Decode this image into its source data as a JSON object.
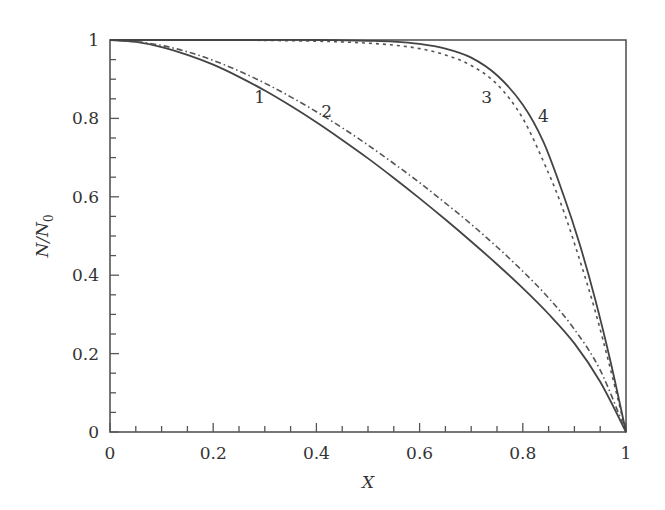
{
  "chart_data": {
    "type": "line",
    "title": "",
    "xlabel": "X",
    "ylabel": "N/N0",
    "ylabel_main": "N/N",
    "ylabel_sub": "0",
    "xlim": [
      0,
      1
    ],
    "ylim": [
      0,
      1
    ],
    "grid": false,
    "legend": "none (curves labeled inline 1–4)",
    "x_ticks": [
      "0",
      "0.2",
      "0.4",
      "0.6",
      "0.8",
      "1"
    ],
    "y_ticks": [
      "0",
      "0.2",
      "0.4",
      "0.6",
      "0.8",
      "1"
    ],
    "minor_tick_step": 0.05,
    "series": [
      {
        "name": "1",
        "style": "solid",
        "x": [
          0,
          0.05,
          0.1,
          0.15,
          0.2,
          0.25,
          0.3,
          0.35,
          0.4,
          0.45,
          0.5,
          0.55,
          0.6,
          0.65,
          0.7,
          0.75,
          0.8,
          0.85,
          0.9,
          0.95,
          1.0
        ],
        "y": [
          1.0,
          0.995,
          0.982,
          0.962,
          0.937,
          0.906,
          0.871,
          0.832,
          0.79,
          0.745,
          0.698,
          0.648,
          0.596,
          0.542,
          0.486,
          0.428,
          0.367,
          0.301,
          0.226,
          0.128,
          0.0
        ]
      },
      {
        "name": "2",
        "style": "dash-dot",
        "x": [
          0,
          0.05,
          0.1,
          0.15,
          0.2,
          0.25,
          0.3,
          0.35,
          0.4,
          0.45,
          0.5,
          0.55,
          0.6,
          0.65,
          0.7,
          0.75,
          0.8,
          0.85,
          0.9,
          0.95,
          1.0
        ],
        "y": [
          1.0,
          0.996,
          0.986,
          0.97,
          0.948,
          0.921,
          0.89,
          0.855,
          0.817,
          0.776,
          0.732,
          0.685,
          0.636,
          0.584,
          0.53,
          0.472,
          0.41,
          0.342,
          0.262,
          0.158,
          0.0
        ]
      },
      {
        "name": "3",
        "style": "dashed",
        "x": [
          0,
          0.1,
          0.2,
          0.3,
          0.4,
          0.45,
          0.5,
          0.55,
          0.6,
          0.65,
          0.7,
          0.75,
          0.8,
          0.85,
          0.88,
          0.91,
          0.94,
          0.97,
          1.0
        ],
        "y": [
          1.0,
          1.0,
          1.0,
          0.999,
          0.997,
          0.995,
          0.992,
          0.987,
          0.978,
          0.962,
          0.935,
          0.887,
          0.8,
          0.66,
          0.56,
          0.44,
          0.31,
          0.16,
          0.0
        ]
      },
      {
        "name": "4",
        "style": "solid",
        "x": [
          0,
          0.1,
          0.2,
          0.3,
          0.4,
          0.5,
          0.55,
          0.6,
          0.65,
          0.7,
          0.75,
          0.8,
          0.84,
          0.88,
          0.91,
          0.94,
          0.97,
          1.0
        ],
        "y": [
          1.0,
          1.0,
          1.0,
          1.0,
          1.0,
          0.998,
          0.996,
          0.99,
          0.978,
          0.955,
          0.91,
          0.835,
          0.74,
          0.6,
          0.48,
          0.34,
          0.18,
          0.0
        ]
      }
    ],
    "annotations": [
      {
        "text": "1",
        "x": 0.29,
        "y": 0.855
      },
      {
        "text": "2",
        "x": 0.42,
        "y": 0.82
      },
      {
        "text": "3",
        "x": 0.73,
        "y": 0.855
      },
      {
        "text": "4",
        "x": 0.84,
        "y": 0.805
      }
    ]
  }
}
